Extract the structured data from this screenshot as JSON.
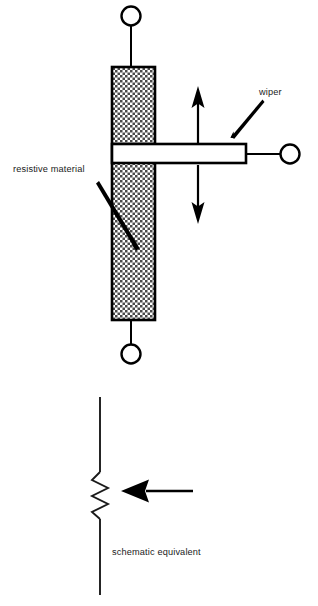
{
  "figure": {
    "domain_type": "technical-line-diagram",
    "background_color": "#ffffff",
    "ink_color": "#000000",
    "hatch_fill_color": "#d9d9d9",
    "labels": {
      "wiper": "wiper",
      "resistive_material": "resistive material",
      "schematic_equivalent": "schematic equivalent"
    },
    "pictorial_view": {
      "resistive_body": {
        "name": "resistive element body",
        "fill_pattern": "cross-hatch stipple",
        "x": 112,
        "y": 67,
        "width": 43,
        "height": 253
      },
      "terminals": [
        {
          "name": "top terminal",
          "cx": 131,
          "cy": 16,
          "r": 10
        },
        {
          "name": "bottom terminal",
          "cx": 131,
          "cy": 354,
          "r": 10
        },
        {
          "name": "wiper terminal",
          "cx": 290,
          "cy": 154,
          "r": 10
        }
      ],
      "wiper_bar": {
        "name": "wiper contact arm",
        "x": 112,
        "y": 144,
        "width": 134,
        "height": 19
      },
      "motion_arrows": [
        {
          "name": "up travel arrow",
          "direction": "up",
          "x": 198,
          "from_y": 145,
          "to_y": 88
        },
        {
          "name": "down travel arrow",
          "direction": "down",
          "x": 198,
          "from_y": 165,
          "to_y": 222
        }
      ]
    },
    "schematic_view": {
      "resistor": {
        "name": "variable resistor zigzag",
        "center_x": 100,
        "zigzag_top_y": 472,
        "zigzag_bottom_y": 519,
        "lead_top_y": 397,
        "lead_bottom_y": 595,
        "zigzag_amplitude": 8,
        "zigzag_peaks": 6
      },
      "tap_arrow": {
        "name": "wiper tap arrow",
        "direction": "left",
        "tip_x": 121,
        "tail_x": 193,
        "y": 491
      }
    }
  }
}
